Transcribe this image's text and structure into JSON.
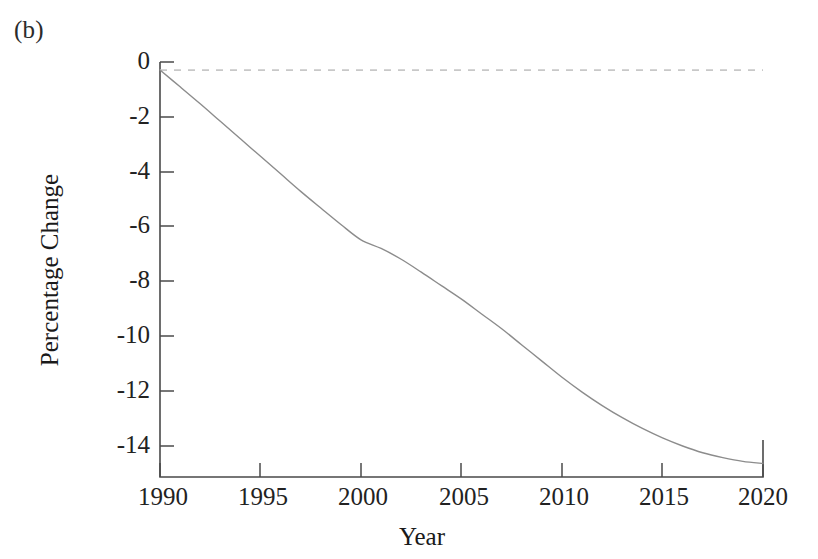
{
  "figure": {
    "panel_label": "(b)",
    "background_color": "#ffffff"
  },
  "chart_data": {
    "type": "line",
    "title": "",
    "subtitle": "",
    "xlabel": "Year",
    "ylabel": "Percentage Change",
    "xlim": [
      1990,
      2020
    ],
    "ylim": [
      -15.1,
      0.3
    ],
    "xticks": [
      1990,
      1995,
      2000,
      2005,
      2010,
      2015,
      2020
    ],
    "xtick_labels": [
      "1990",
      "1995",
      "2000",
      "2005",
      "2010",
      "2015",
      "2020"
    ],
    "yticks": [
      0,
      -2,
      -4,
      -6,
      -8,
      -10,
      -12,
      -14
    ],
    "ytick_labels": [
      "0",
      "-2",
      "-4",
      "-6",
      "-8",
      "-10",
      "-12",
      "-14"
    ],
    "grid": false,
    "legend": null,
    "legend_position": "none",
    "line_color": "#8c8c8c",
    "line_width": 1.4,
    "reference_line": {
      "name": "zero-line",
      "y": 0,
      "style": "dashed",
      "color": "#c8c8c8",
      "x_start": 1990,
      "x_end": 2020
    },
    "x": [
      1990,
      1991,
      1992,
      1993,
      1994,
      1995,
      1996,
      1997,
      1998,
      1999,
      2000,
      2001,
      2002,
      2003,
      2004,
      2005,
      2006,
      2007,
      2008,
      2009,
      2010,
      2011,
      2012,
      2013,
      2014,
      2015,
      2016,
      2017,
      2018,
      2019,
      2020
    ],
    "series": [
      {
        "name": "Percentage Change",
        "values": [
          0.0,
          -0.62,
          -1.25,
          -1.9,
          -2.55,
          -3.2,
          -3.85,
          -4.5,
          -5.12,
          -5.73,
          -6.3,
          -6.62,
          -7.02,
          -7.5,
          -8.0,
          -8.5,
          -9.05,
          -9.6,
          -10.2,
          -10.8,
          -11.4,
          -11.95,
          -12.45,
          -12.9,
          -13.3,
          -13.65,
          -13.95,
          -14.2,
          -14.38,
          -14.52,
          -14.6
        ]
      }
    ]
  },
  "geometry": {
    "plot_left": 160,
    "plot_right": 763,
    "plot_top": 62,
    "plot_bottom": 477
  }
}
